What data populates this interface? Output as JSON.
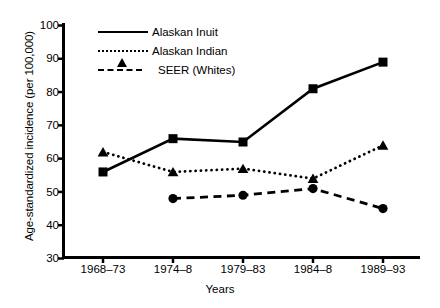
{
  "chart_data": {
    "type": "line",
    "title": "",
    "xlabel": "Years",
    "ylabel": "Age-standardized incidence (per 100,000)",
    "categories": [
      "1968–73",
      "1974–8",
      "1979–83",
      "1984–8",
      "1989–93"
    ],
    "ylim": [
      30,
      100
    ],
    "yticks": [
      30,
      40,
      50,
      60,
      70,
      80,
      90,
      100
    ],
    "grid": false,
    "legend_position": "top-center",
    "series": [
      {
        "name": "Alaskan Inuit",
        "values": [
          56,
          66,
          65,
          81,
          89
        ],
        "line_style": "solid",
        "marker": "square",
        "color": "#000000"
      },
      {
        "name": "Alaskan Indian",
        "values": [
          62,
          56,
          57,
          54,
          64
        ],
        "line_style": "dotted",
        "marker": "triangle",
        "color": "#000000"
      },
      {
        "name": "SEER (Whites)",
        "values": [
          null,
          48,
          49,
          51,
          45
        ],
        "line_style": "dashed",
        "marker": "circle",
        "color": "#000000"
      }
    ]
  },
  "axes": {
    "y_tick_labels": [
      "100",
      "90",
      "80",
      "70",
      "60",
      "50",
      "40",
      "30"
    ],
    "y_title": "Age-standardized incidence (per 100,000)",
    "x_tick_labels": [
      "1968–73",
      "1974–8",
      "1979–83",
      "1984–8",
      "1989–93"
    ],
    "x_title": "Years"
  },
  "legend": {
    "items": [
      {
        "label": "Alaskan Inuit",
        "marker": "square-marker",
        "line": "solid-line"
      },
      {
        "label": "Alaskan Indian",
        "marker": "triangle-marker",
        "line": "dotted-line"
      },
      {
        "label": "SEER (Whites)",
        "marker": "circle-marker",
        "line": "dashed-line"
      }
    ]
  }
}
